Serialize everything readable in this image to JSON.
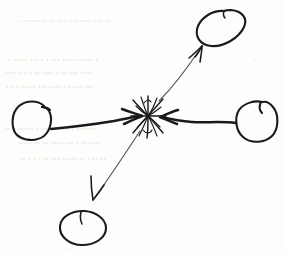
{
  "document": {
    "kind": "hand-drawn-sketch",
    "medium": "black ink pen on white paper",
    "title": "Four nodes converging and diverging from a central burst",
    "background_color": "#fdfdfc",
    "ink_color": "#1b1a19",
    "faint_ink_color": "#3a3a38",
    "ghost_text_color": "#ebeae8",
    "width": 283,
    "height": 255
  },
  "diagram": {
    "center": {
      "name": "collision-burst",
      "label": "",
      "description": "scribbled star / asterisk burst",
      "x": 148,
      "y": 115,
      "spokes": 9
    },
    "nodes": [
      {
        "id": "left",
        "name": "left-circle",
        "label": "",
        "shape": "circle",
        "cx": 32,
        "cy": 120,
        "rx": 21,
        "ry": 20,
        "rotation": -8,
        "has_open_notch": true,
        "notch_position": "top-right"
      },
      {
        "id": "right",
        "name": "right-circle",
        "label": "",
        "shape": "circle",
        "cx": 257,
        "cy": 121,
        "rx": 21,
        "ry": 21,
        "rotation": 6,
        "has_open_notch": true,
        "notch_position": "top"
      },
      {
        "id": "top-right",
        "name": "top-right-oval",
        "label": "",
        "shape": "ellipse",
        "cx": 222,
        "cy": 28,
        "rx": 25,
        "ry": 18,
        "rotation": -34,
        "has_open_notch": true,
        "notch_position": "top"
      },
      {
        "id": "bottom-left",
        "name": "bottom-left-oval",
        "label": "",
        "shape": "ellipse",
        "cx": 83,
        "cy": 228,
        "rx": 23,
        "ry": 17,
        "rotation": -8,
        "has_open_notch": true,
        "notch_position": "top"
      }
    ],
    "arrows": [
      {
        "id": "left-in",
        "name": "arrow-left-to-center",
        "label": "",
        "from": "left",
        "to": "center",
        "direction": "inward",
        "weight": "thick",
        "from_point": [
          53,
          128
        ],
        "to_point": [
          140,
          116
        ],
        "arrowhead_at": "center"
      },
      {
        "id": "right-in",
        "name": "arrow-right-to-center",
        "label": "",
        "from": "right",
        "to": "center",
        "direction": "inward",
        "weight": "thick",
        "from_point": [
          236,
          122
        ],
        "to_point": [
          160,
          116
        ],
        "arrowhead_at": "center"
      },
      {
        "id": "top-right-out",
        "name": "arrow-center-to-top-right",
        "label": "",
        "from": "center",
        "to": "top-right",
        "direction": "outward",
        "weight": "thin",
        "from_point": [
          158,
          100
        ],
        "to_point": [
          201,
          45
        ],
        "arrowhead_at": "top-right"
      },
      {
        "id": "bottom-left-out",
        "name": "arrow-center-to-bottom-left",
        "label": "",
        "from": "center",
        "to": "bottom-left",
        "direction": "outward",
        "weight": "thin",
        "from_point": [
          140,
          130
        ],
        "to_point": [
          92,
          200
        ],
        "arrowhead_at": "bottom-left"
      }
    ],
    "ghost_text": {
      "name": "bleed-through-text",
      "legible": false,
      "description": "faint illegible text bleeding through from the reverse side of the page",
      "lines": [
        "• ••••• •• •• ••• • •••••• ••• ••",
        "• ••••• ••• • • ••• •••• •••••• •",
        "•••• • • • •• •••• • •• ••• ••••",
        "• • • ••••• ••• •••• • ••••• •••",
        "•••••••••• • •••••• • • • •••••••",
        "••••• •• •• ••••• •• • •• ••••",
        "•• • • • •• ••• ••••• •• • •• ••"
      ]
    }
  }
}
